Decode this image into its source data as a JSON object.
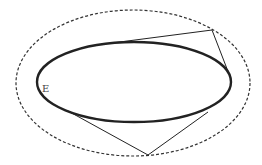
{
  "diagram": {
    "label_E": "E",
    "colors": {
      "stroke": "#222222",
      "dashed": "#333333",
      "label": "#444444",
      "background": "#ffffff"
    },
    "elements": [
      {
        "name": "inner-ellipse",
        "style": "solid-thick"
      },
      {
        "name": "outer-ellipse",
        "style": "dashed"
      },
      {
        "name": "upper-tangent-lines",
        "description": "two tangent lines from a point on the outer ellipse (upper right) to the inner ellipse"
      },
      {
        "name": "lower-tangent-lines",
        "description": "two tangent lines from a point on the outer ellipse (bottom) to the inner ellipse"
      }
    ]
  }
}
